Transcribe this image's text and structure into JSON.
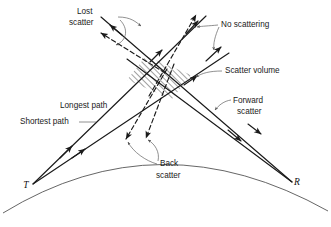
{
  "figure": {
    "background_color": "#ffffff",
    "line_color": "#1a1a1a",
    "leader_color": "#555555",
    "earth_color": "#555555"
  },
  "nodes": {
    "transmitter": {
      "label": "T",
      "x": 33,
      "y": 184
    },
    "receiver": {
      "label": "R",
      "x": 292,
      "y": 182
    }
  },
  "labels": {
    "lost_scatter": {
      "line1": "Lost",
      "line2": "scatter",
      "x": 93,
      "y": 12
    },
    "no_scattering": {
      "text": "No scattering",
      "x": 220,
      "y": 24
    },
    "scatter_volume": {
      "text": "Scatter volume",
      "x": 224,
      "y": 71
    },
    "longest_path": {
      "text": "Longest path",
      "x": 60,
      "y": 106
    },
    "shortest_path": {
      "text": "Shortest path",
      "x": 20,
      "y": 122
    },
    "forward_scatter": {
      "line1": "Forward",
      "line2": "scatter",
      "x": 232,
      "y": 101
    },
    "back_scatter": {
      "line1": "Back",
      "line2": "scatter",
      "x": 160,
      "y": 163
    }
  },
  "regions": {
    "scatter_volume": {
      "name": "scatter-volume",
      "hatch_direction": "forward-slash",
      "points": "146,56 190,74 172,98 128,80"
    }
  },
  "geometry": {
    "earth_arc": "M 3,213 Q 160,118 328,211",
    "rays": [
      {
        "name": "tx-longest-path",
        "style": "solid",
        "path": "M 33,184 L 205,15"
      },
      {
        "name": "tx-shortest-path",
        "style": "solid",
        "path": "M 33,184 L 228,52"
      },
      {
        "name": "rx-upper-ray",
        "style": "solid",
        "path": "M 292,182 L 102,18"
      },
      {
        "name": "rx-lower-ray",
        "style": "solid",
        "path": "M 292,182 L 128,60"
      },
      {
        "name": "lost-scatter-left",
        "style": "dashed",
        "path": "M 162,72 L 99,33"
      },
      {
        "name": "lost-scatter-right",
        "style": "dashed",
        "path": "M 150,95 L 195,14"
      },
      {
        "name": "back-scatter-left",
        "style": "dashed",
        "path": "M 166,70 L 124,141"
      },
      {
        "name": "back-scatter-right",
        "style": "dashed",
        "path": "M 172,66 L 144,140"
      }
    ]
  }
}
